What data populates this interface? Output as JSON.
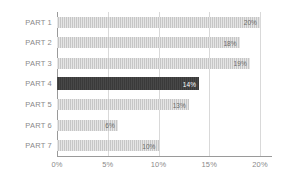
{
  "chart_data": {
    "type": "bar",
    "orientation": "horizontal",
    "title": "",
    "subtitle": "",
    "xlabel": "",
    "ylabel": "",
    "categories": [
      "PART 1",
      "PART 2",
      "PART 3",
      "PART 4",
      "PART 5",
      "PART 6",
      "PART 7"
    ],
    "values": [
      20,
      18,
      19,
      14,
      13,
      6,
      10
    ],
    "data_labels": [
      "20%",
      "18%",
      "19%",
      "14%",
      "13%",
      "6%",
      "10%"
    ],
    "xlim": [
      0,
      20
    ],
    "xticks": [
      0,
      5,
      10,
      15,
      20
    ],
    "xtick_labels": [
      "0%",
      "5%",
      "10%",
      "15%",
      "20%"
    ],
    "grid": true,
    "grid_axis": "x",
    "legend": false,
    "highlight_index": 3,
    "colors": {
      "bar": "#c6c6c6",
      "bar_highlight": "#3a3a3a",
      "data_label": "#6b6b6b",
      "data_label_highlight": "#ffffff",
      "category_label": "#8a8a8a",
      "tick_label": "#8a8a8a",
      "gridline": "#d9d9d9",
      "axis": "#9a9a9a",
      "background": "#ffffff"
    }
  }
}
